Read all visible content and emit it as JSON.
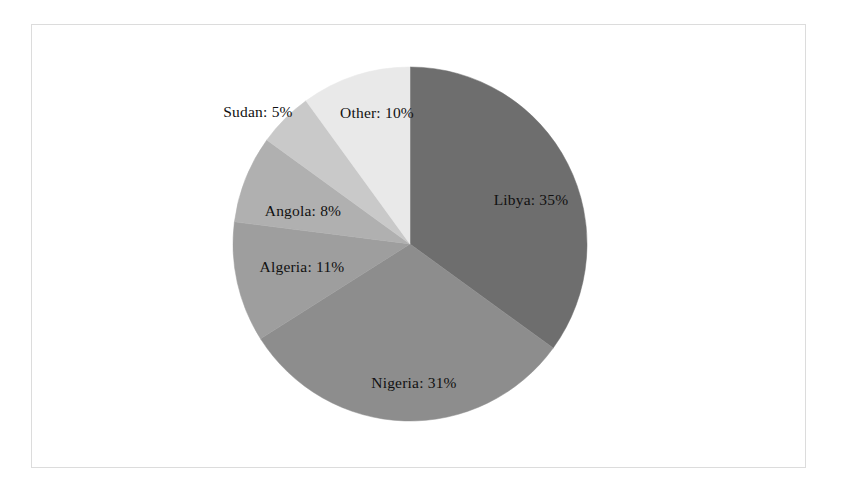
{
  "figure": {
    "background_color": "#ffffff",
    "frame_color": "#dcdcdc",
    "label_color": "#111111"
  },
  "chart_data": {
    "type": "pie",
    "title": "",
    "subtitle": "",
    "xlabel": "",
    "ylabel": "",
    "legend_position": "none",
    "grid": false,
    "start_angle_deg": 90,
    "direction": "clockwise",
    "units": "percent",
    "categories": [
      "Libya",
      "Nigeria",
      "Algeria",
      "Angola",
      "Sudan",
      "Other"
    ],
    "values": [
      35,
      31,
      11,
      8,
      5,
      10
    ],
    "labels": [
      "Libya: 35%",
      "Nigeria: 31%",
      "Algeria: 11%",
      "Angola: 8%",
      "Sudan: 5%",
      "Other: 10%"
    ],
    "colors": [
      "#6e6e6e",
      "#8d8d8d",
      "#9e9e9e",
      "#b0b0b0",
      "#c9c9c9",
      "#e9e9e9"
    ],
    "slices": [
      {
        "name": "Libya",
        "value": 35,
        "label": "Libya: 35%",
        "color": "#6e6e6e",
        "label_x": 531,
        "label_y": 200
      },
      {
        "name": "Nigeria",
        "value": 31,
        "label": "Nigeria: 31%",
        "color": "#8d8d8d",
        "label_x": 414,
        "label_y": 383
      },
      {
        "name": "Algeria",
        "value": 11,
        "label": "Algeria: 11%",
        "color": "#9e9e9e",
        "label_x": 302,
        "label_y": 267
      },
      {
        "name": "Angola",
        "value": 8,
        "label": "Angola: 8%",
        "color": "#b0b0b0",
        "label_x": 303,
        "label_y": 211
      },
      {
        "name": "Sudan",
        "value": 5,
        "label": "Sudan: 5%",
        "color": "#c9c9c9",
        "label_x": 258,
        "label_y": 112
      },
      {
        "name": "Other",
        "value": 10,
        "label": "Other: 10%",
        "color": "#e9e9e9",
        "label_x": 377,
        "label_y": 113
      }
    ],
    "geometry": {
      "center_x": 410,
      "center_y": 244,
      "radius": 177
    }
  }
}
